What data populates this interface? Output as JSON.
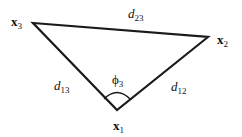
{
  "diagram": {
    "vertices": [
      {
        "id": "x1",
        "label": "x",
        "sub": "1",
        "x": 117,
        "y": 110
      },
      {
        "id": "x2",
        "label": "x",
        "sub": "2",
        "x": 208,
        "y": 37
      },
      {
        "id": "x3",
        "label": "x",
        "sub": "3",
        "x": 33,
        "y": 23
      }
    ],
    "edges": [
      {
        "from": "x3",
        "to": "x2",
        "label": "d",
        "sub": "23"
      },
      {
        "from": "x3",
        "to": "x1",
        "label": "d",
        "sub": "13"
      },
      {
        "from": "x1",
        "to": "x2",
        "label": "d",
        "sub": "12"
      }
    ],
    "angle": {
      "at": "x1",
      "label": "ϕ",
      "sub": "3"
    },
    "colors": {
      "line": "#1a1a1a",
      "background": "#ffffff"
    }
  }
}
